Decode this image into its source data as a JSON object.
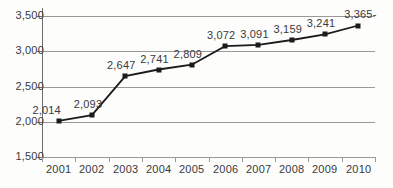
{
  "chart_data": {
    "type": "line",
    "title": "",
    "xlabel": "",
    "ylabel": "",
    "categories": [
      "2001",
      "2002",
      "2003",
      "2004",
      "2005",
      "2006",
      "2007",
      "2008",
      "2009",
      "2010"
    ],
    "values": [
      2014,
      2093,
      2647,
      2741,
      2809,
      3072,
      3091,
      3159,
      3241,
      3365
    ],
    "point_labels": [
      "2,014",
      "2,093",
      "2,647",
      "2,741",
      "2,809",
      "3,072",
      "3,091",
      "3,159",
      "3,241",
      "3,365-"
    ],
    "ylim": [
      1500,
      3500
    ],
    "ytick_values": [
      1500,
      2000,
      2500,
      3000,
      3500
    ],
    "ytick_labels": [
      "1,500",
      "2,000",
      "2,500",
      "3,000",
      "3,500"
    ],
    "grid": true,
    "legend": "none",
    "series_color": "#1b1b1b",
    "gridline_color": "#9a9a9a",
    "axis_color": "#6e6e6e",
    "text_color": "#39393b",
    "background_color": "#fdfdfb",
    "marker": "square"
  }
}
